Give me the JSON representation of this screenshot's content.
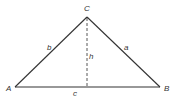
{
  "diagram": {
    "type": "triangle-with-altitude",
    "vertices": {
      "A": {
        "label": "A",
        "x": 15,
        "y": 87
      },
      "B": {
        "label": "B",
        "x": 160,
        "y": 87
      },
      "C": {
        "label": "C",
        "x": 87,
        "y": 17
      }
    },
    "sides": {
      "a": {
        "label": "a",
        "between": [
          "C",
          "B"
        ]
      },
      "b": {
        "label": "b",
        "between": [
          "A",
          "C"
        ]
      },
      "c": {
        "label": "c",
        "between": [
          "A",
          "B"
        ]
      }
    },
    "altitude": {
      "label": "h",
      "from": "C",
      "style": "dashed"
    },
    "colors": {
      "stroke": "#333333",
      "background": "#ffffff"
    }
  }
}
